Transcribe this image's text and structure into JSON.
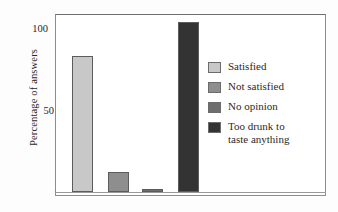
{
  "chart_data": {
    "type": "bar",
    "title": "",
    "subtitle": "",
    "xlabel": "",
    "ylabel": "Percentage of answers",
    "categories": [
      "Satisfied",
      "Not satisfied",
      "No opinion",
      "Too drunk to taste anything"
    ],
    "values": [
      80,
      12,
      2,
      100
    ],
    "ylim": [
      0,
      105
    ],
    "yticks": [
      0,
      50,
      100
    ],
    "ytick_labels": [
      "0",
      "50",
      "100"
    ],
    "xticks": [],
    "xtick_labels": [],
    "grid": false,
    "legend_position": "right-inside",
    "series": [
      {
        "name": "Percentage of answers",
        "values": [
          80,
          12,
          2,
          100
        ]
      }
    ],
    "bar_colors": [
      "#c8c8c8",
      "#8e8e8e",
      "#6e6e6e",
      "#333333"
    ],
    "annotations": []
  },
  "axes": {
    "y_title": "Percentage of answers",
    "ticks": [
      {
        "label": "100",
        "value": 100
      },
      {
        "label": "50",
        "value": 50
      },
      {
        "label": "0",
        "value": 0
      }
    ]
  },
  "legend": {
    "items": [
      {
        "label": "Satisfied",
        "color": "#c8c8c8",
        "value": 80
      },
      {
        "label": "Not satisfied",
        "color": "#8e8e8e",
        "value": 12
      },
      {
        "label": "No opinion",
        "color": "#6e6e6e",
        "value": 2
      },
      {
        "label": "Too drunk to\ntaste anything",
        "color": "#333333",
        "value": 100
      }
    ]
  },
  "colors": {
    "frame": "#8d8d8d",
    "text": "#2a2a2a",
    "background": "#ffffff"
  }
}
